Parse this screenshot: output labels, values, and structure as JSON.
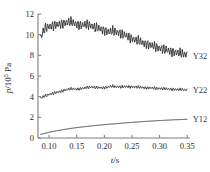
{
  "chart_data": {
    "type": "line",
    "title": "",
    "xlabel": "t/s",
    "ylabel": "p/10^5 Pa",
    "ylabel_parts": {
      "symbol": "p",
      "divider": "/10",
      "exponent": "5",
      "unit": " Pa"
    },
    "xlabel_parts": {
      "symbol": "t",
      "unit": "/s"
    },
    "xlim": [
      0.08,
      0.355
    ],
    "ylim": [
      0,
      12
    ],
    "xticks": [
      0.1,
      0.15,
      0.2,
      0.25,
      0.3,
      0.35
    ],
    "xtick_labels": [
      "0.10",
      "0.15",
      "0.20",
      "0.25",
      "0.30",
      "0.35"
    ],
    "yticks": [
      0,
      2,
      4,
      6,
      8,
      10,
      12
    ],
    "ytick_labels": [
      "0",
      "2",
      "4",
      "6",
      "8",
      "10",
      "12"
    ],
    "grid": false,
    "legend_position": "right-inline",
    "line_color": "#252525",
    "axis_color": "#7d7d7d",
    "series": [
      {
        "name": "Y32",
        "label": "Y32",
        "label_x": 0.358,
        "label_y": 7.9,
        "oscillation_amplitude": 0.42,
        "oscillation_period": 0.0042,
        "x": [
          0.085,
          0.09,
          0.095,
          0.1,
          0.105,
          0.11,
          0.115,
          0.12,
          0.125,
          0.13,
          0.135,
          0.14,
          0.145,
          0.15,
          0.155,
          0.16,
          0.165,
          0.17,
          0.175,
          0.18,
          0.185,
          0.19,
          0.195,
          0.2,
          0.205,
          0.21,
          0.215,
          0.22,
          0.225,
          0.23,
          0.235,
          0.24,
          0.245,
          0.25,
          0.255,
          0.26,
          0.265,
          0.27,
          0.275,
          0.28,
          0.285,
          0.29,
          0.295,
          0.3,
          0.305,
          0.31,
          0.315,
          0.32,
          0.325,
          0.33,
          0.335,
          0.34,
          0.345,
          0.35
        ],
        "values": [
          9.7,
          10.35,
          10.7,
          10.82,
          10.86,
          10.88,
          10.92,
          11.0,
          11.1,
          11.18,
          11.22,
          11.2,
          11.12,
          11.02,
          10.95,
          10.9,
          10.94,
          10.98,
          10.92,
          10.8,
          10.68,
          10.58,
          10.5,
          10.42,
          10.34,
          10.28,
          10.34,
          10.3,
          10.22,
          10.12,
          10.0,
          9.88,
          9.76,
          9.64,
          9.52,
          9.42,
          9.32,
          9.22,
          9.12,
          9.02,
          8.94,
          8.86,
          8.78,
          8.7,
          8.62,
          8.54,
          8.46,
          8.4,
          8.34,
          8.28,
          8.22,
          8.16,
          8.12,
          8.1
        ]
      },
      {
        "name": "Y22",
        "label": "Y22",
        "label_x": 0.358,
        "label_y": 4.62,
        "oscillation_amplitude": 0.13,
        "oscillation_period": 0.0042,
        "x": [
          0.085,
          0.09,
          0.095,
          0.1,
          0.105,
          0.11,
          0.115,
          0.12,
          0.125,
          0.13,
          0.135,
          0.14,
          0.145,
          0.15,
          0.155,
          0.16,
          0.165,
          0.17,
          0.175,
          0.18,
          0.185,
          0.19,
          0.195,
          0.2,
          0.205,
          0.21,
          0.215,
          0.22,
          0.225,
          0.23,
          0.235,
          0.24,
          0.245,
          0.25,
          0.255,
          0.26,
          0.265,
          0.27,
          0.275,
          0.28,
          0.285,
          0.29,
          0.295,
          0.3,
          0.305,
          0.31,
          0.315,
          0.32,
          0.325,
          0.33,
          0.335,
          0.34,
          0.345,
          0.35
        ],
        "values": [
          3.85,
          4.0,
          4.12,
          4.22,
          4.3,
          4.36,
          4.42,
          4.5,
          4.58,
          4.66,
          4.72,
          4.74,
          4.74,
          4.74,
          4.76,
          4.8,
          4.84,
          4.9,
          4.94,
          4.92,
          4.88,
          4.86,
          4.86,
          4.88,
          4.92,
          4.98,
          5.0,
          4.96,
          4.96,
          4.96,
          4.96,
          4.96,
          4.96,
          4.96,
          4.94,
          4.92,
          4.9,
          4.88,
          4.86,
          4.86,
          4.84,
          4.82,
          4.8,
          4.8,
          4.78,
          4.76,
          4.74,
          4.72,
          4.72,
          4.7,
          4.68,
          4.68,
          4.66,
          4.66
        ]
      },
      {
        "name": "Y12",
        "label": "Y12",
        "label_x": 0.358,
        "label_y": 1.8,
        "oscillation_amplitude": 0.0,
        "oscillation_period": 0.0,
        "x": [
          0.085,
          0.09,
          0.095,
          0.1,
          0.105,
          0.11,
          0.115,
          0.12,
          0.125,
          0.13,
          0.135,
          0.14,
          0.145,
          0.15,
          0.155,
          0.16,
          0.165,
          0.17,
          0.175,
          0.18,
          0.185,
          0.19,
          0.195,
          0.2,
          0.205,
          0.21,
          0.215,
          0.22,
          0.225,
          0.23,
          0.235,
          0.24,
          0.245,
          0.25,
          0.255,
          0.26,
          0.265,
          0.27,
          0.275,
          0.28,
          0.285,
          0.29,
          0.295,
          0.3,
          0.305,
          0.31,
          0.315,
          0.32,
          0.325,
          0.33,
          0.335,
          0.34,
          0.345,
          0.35
        ],
        "values": [
          0.35,
          0.42,
          0.49,
          0.55,
          0.61,
          0.66,
          0.71,
          0.76,
          0.81,
          0.85,
          0.89,
          0.93,
          0.97,
          1.0,
          1.04,
          1.07,
          1.1,
          1.13,
          1.16,
          1.19,
          1.21,
          1.24,
          1.26,
          1.29,
          1.31,
          1.34,
          1.36,
          1.38,
          1.4,
          1.43,
          1.45,
          1.47,
          1.49,
          1.51,
          1.53,
          1.55,
          1.57,
          1.59,
          1.61,
          1.62,
          1.64,
          1.66,
          1.67,
          1.69,
          1.7,
          1.72,
          1.73,
          1.74,
          1.76,
          1.77,
          1.78,
          1.79,
          1.8,
          1.81
        ]
      }
    ]
  }
}
